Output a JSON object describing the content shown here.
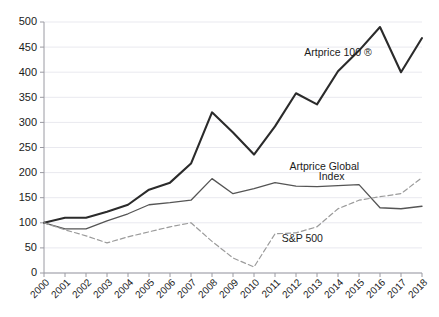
{
  "chart_data": {
    "type": "line",
    "title": "",
    "xlabel": "",
    "ylabel": "",
    "xlim": [
      2000,
      2018
    ],
    "ylim": [
      0,
      500
    ],
    "grid": true,
    "legend_position": "inline-annotations",
    "categories": [
      2000,
      2001,
      2002,
      2003,
      2004,
      2005,
      2006,
      2007,
      2008,
      2009,
      2010,
      2011,
      2012,
      2013,
      2014,
      2015,
      2016,
      2017,
      2018
    ],
    "ytick_labels": [
      "0",
      "50",
      "100",
      "150",
      "200",
      "250",
      "300",
      "350",
      "400",
      "450",
      "500"
    ],
    "ytick_values": [
      0,
      50,
      100,
      150,
      200,
      250,
      300,
      350,
      400,
      450,
      500
    ],
    "xtick_labels": [
      "2000",
      "2001",
      "2002",
      "2003",
      "2004",
      "2005",
      "2006",
      "2007",
      "2008",
      "2009",
      "2010",
      "2011",
      "2012",
      "2013",
      "2014",
      "2015",
      "2016",
      "2017",
      "2018"
    ],
    "series": [
      {
        "name": "Artprice 100 ®",
        "style": "solid-thick",
        "color": "#2b2b2b",
        "values": [
          100,
          110,
          110,
          122,
          136,
          166,
          180,
          218,
          320,
          280,
          236,
          292,
          358,
          336,
          402,
          443,
          490,
          400,
          468
        ]
      },
      {
        "name": "Artprice Global Index",
        "style": "solid-thin",
        "color": "#555555",
        "values": [
          100,
          88,
          88,
          104,
          118,
          136,
          140,
          145,
          188,
          158,
          168,
          180,
          173,
          172,
          174,
          176,
          130,
          128,
          133
        ]
      },
      {
        "name": "S&P 500",
        "style": "dashed",
        "color": "#9b9b9b",
        "values": [
          100,
          86,
          74,
          60,
          72,
          82,
          92,
          100,
          63,
          30,
          12,
          78,
          80,
          92,
          128,
          145,
          152,
          158,
          190
        ]
      }
    ],
    "annotations": [
      {
        "name": "artprice-100-label",
        "text": "Artprice 100 ®",
        "x": 2014.0,
        "y": 432
      },
      {
        "name": "artprice-global-index-label",
        "text": "Artprice Global",
        "x": 2013.35,
        "y": 205
      },
      {
        "name": "artprice-global-index-label-2",
        "text": "Index",
        "x": 2013.7,
        "y": 186
      },
      {
        "name": "sp500-label",
        "text": "S&P 500",
        "x": 2012.3,
        "y": 62
      }
    ]
  }
}
